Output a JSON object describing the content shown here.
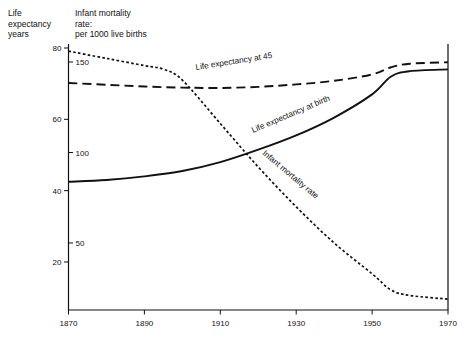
{
  "header": {
    "left_axis_title": "Life\nexpectancy\nyears",
    "right_axis_title": "Infant mortality\nrate:\nper 1000 live births"
  },
  "chart_data": {
    "type": "line",
    "title": "",
    "xlabel": "",
    "ylabel": "Life expectancy years",
    "y2label": "Infant mortality rate: per 1000 live births",
    "xlim": [
      1870,
      1970
    ],
    "ylim": [
      14,
      82
    ],
    "y2lim": [
      12,
      163
    ],
    "grid": false,
    "legend": "inline-labels",
    "x_ticks": [
      "1870",
      "1890",
      "1910",
      "1930",
      "1950",
      "1970"
    ],
    "y_ticks": [
      "80",
      "60",
      "40",
      "20"
    ],
    "y2_ticks": [
      "150",
      "100",
      "50"
    ],
    "series": [
      {
        "name": "Life expectancy at 45",
        "label": "Life expectancy at 45",
        "axis": "left",
        "style": "dashed",
        "x": [
          1870,
          1880,
          1890,
          1900,
          1910,
          1920,
          1930,
          1940,
          1950,
          1955,
          1960,
          1970
        ],
        "values": [
          70.2,
          69.7,
          69.2,
          68.9,
          68.8,
          69.1,
          69.8,
          70.8,
          72.6,
          74.6,
          75.6,
          76.0
        ]
      },
      {
        "name": "Life expectancy at birth",
        "label": "Life expectancy at birth",
        "axis": "left",
        "style": "solid",
        "x": [
          1870,
          1880,
          1890,
          1900,
          1910,
          1920,
          1930,
          1940,
          1950,
          1955,
          1960,
          1970
        ],
        "values": [
          42.5,
          43.0,
          44.0,
          45.5,
          48.0,
          51.5,
          55.5,
          60.5,
          67.0,
          72.0,
          73.5,
          74.0
        ]
      },
      {
        "name": "Infant mortality rate",
        "label": "Infant mortality rate",
        "axis": "right",
        "style": "dotted",
        "x": [
          1870,
          1880,
          1890,
          1895,
          1900,
          1910,
          1920,
          1930,
          1940,
          1950,
          1955,
          1960,
          1970
        ],
        "values": [
          156,
          152,
          148,
          146,
          140,
          116,
          92,
          70,
          50,
          33,
          24,
          21,
          19
        ]
      }
    ]
  }
}
